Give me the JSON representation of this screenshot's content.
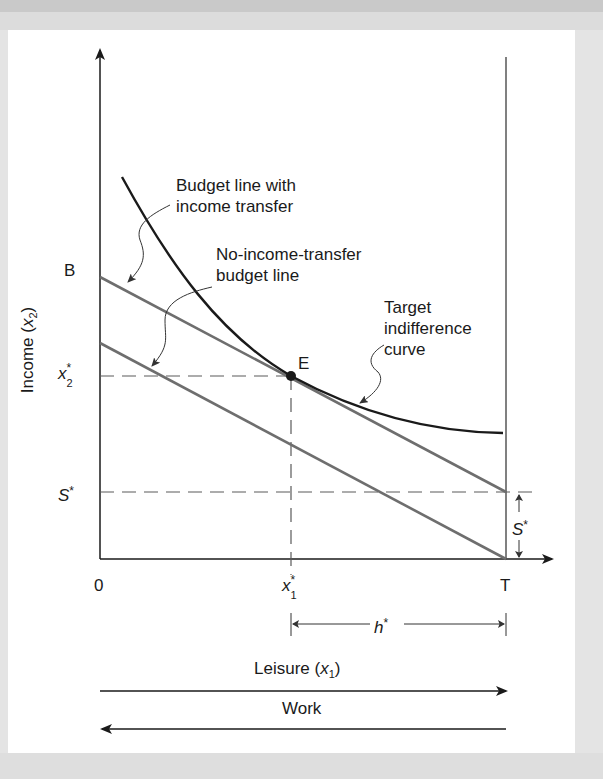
{
  "figure": {
    "y_axis_label": "Income (",
    "y_axis_var": "x",
    "y_axis_sub": "2",
    "y_axis_close": ")",
    "x_axis_label": "Leisure (",
    "x_axis_var": "x",
    "x_axis_sub": "1",
    "x_axis_close": ")",
    "work_label": "Work",
    "origin_label": "0",
    "t_label": "T",
    "b_label": "B",
    "e_label": "E",
    "x2_star": {
      "var": "x",
      "sub": "2",
      "sup": "*"
    },
    "x1_star": {
      "var": "x",
      "sub": "1",
      "sup": "*"
    },
    "s_star_axis": {
      "var": "S",
      "sup": "*"
    },
    "s_star_gap": {
      "var": "S",
      "sup": "*"
    },
    "h_star": {
      "var": "h",
      "sup": "*"
    },
    "annotations": {
      "budget_with_transfer_line1": "Budget line with",
      "budget_with_transfer_line2": "income transfer",
      "no_transfer_line1": "No-income-transfer",
      "no_transfer_line2": "budget line",
      "target_line1": "Target",
      "target_line2": "indifference",
      "target_line3": "curve"
    }
  },
  "colors": {
    "axis": "#1a1a1a",
    "budget_lines": "#6e6e6e",
    "indifference_curve": "#1a1a1a",
    "dashed": "#5a5a5a",
    "panel": "#ffffff",
    "background": "#e4e4e4"
  }
}
